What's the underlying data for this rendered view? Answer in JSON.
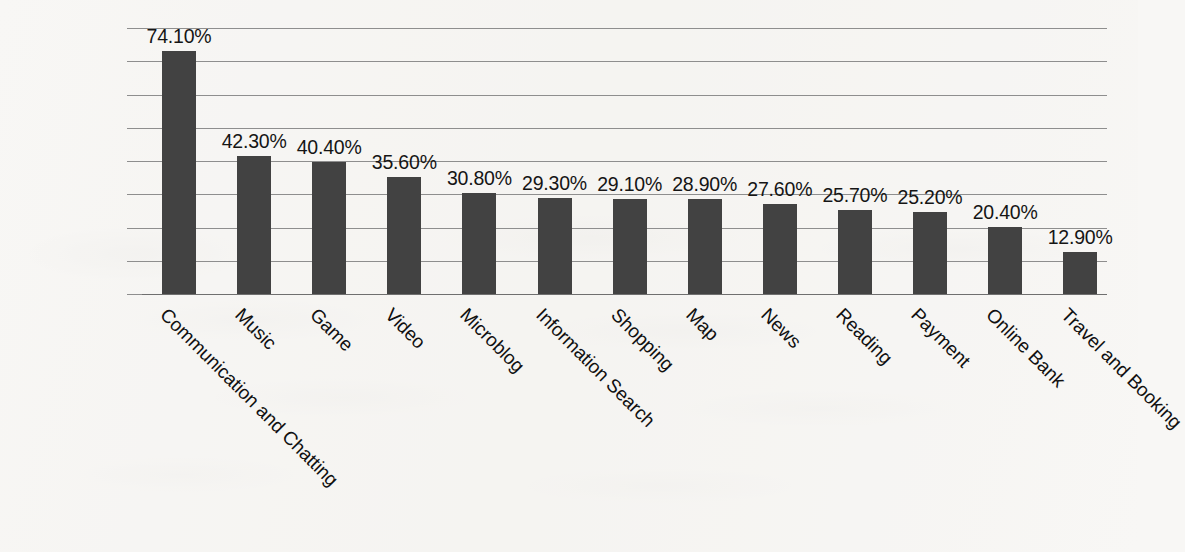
{
  "chart_data": {
    "type": "bar",
    "title": "",
    "subtitle": "",
    "xlabel": "",
    "ylabel": "",
    "ylim": [
      0,
      81.25
    ],
    "grid": true,
    "gridlines": 9,
    "legend": "none",
    "orientation": "vertical",
    "value_label_format": "percent-2dp",
    "categories": [
      "Communication and Chatting",
      "Music",
      "Game",
      "Video",
      "Microblog",
      "Information Search",
      "Shopping",
      "Map",
      "News",
      "Reading",
      "Payment",
      "Online Bank",
      "Travel and Booking"
    ],
    "values": [
      74.1,
      42.3,
      40.4,
      35.6,
      30.8,
      29.3,
      29.1,
      28.9,
      27.6,
      25.7,
      25.2,
      20.4,
      12.9
    ],
    "value_labels": [
      "74.10%",
      "42.30%",
      "40.40%",
      "35.60%",
      "30.80%",
      "29.30%",
      "29.10%",
      "28.90%",
      "27.60%",
      "25.70%",
      "25.20%",
      "20.40%",
      "12.90%"
    ],
    "colors": {
      "bar": "#424242",
      "gridline": "#8e8e8e",
      "axis": "#6f6f6f",
      "background": "#f8f7f5",
      "text": "#101010"
    }
  }
}
